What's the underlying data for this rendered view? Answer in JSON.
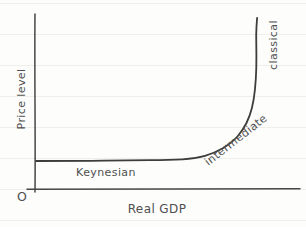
{
  "figure": {
    "origin_label": "O",
    "colors": {
      "ink": "#474747",
      "curve_ink": "#3d3d3d",
      "paper": "#fdfdfc",
      "ruled_line": "#efefec",
      "label_gray": "#4f4f4f"
    }
  },
  "chart_data": {
    "type": "line",
    "title": "",
    "xlabel": "Real GDP",
    "ylabel": "Price level",
    "xlim": [
      0,
      100
    ],
    "ylim": [
      0,
      100
    ],
    "grid": false,
    "axis_ticks": "none",
    "series": [
      {
        "name": "aggregate-supply-curve",
        "x": [
          0.4,
          17.0,
          35.8,
          50.9,
          60.4,
          67.9,
          74.3,
          78.5,
          81.1,
          82.6,
          83.4,
          83.6,
          83.4,
          83.8
        ],
        "y": [
          16.0,
          16.0,
          16.3,
          16.6,
          17.4,
          20.6,
          26.3,
          33.7,
          41.7,
          50.9,
          62.3,
          76.6,
          88.0,
          97.7
        ]
      }
    ],
    "annotations": [
      {
        "text": "Keynesian",
        "x": 26.8,
        "y": 9.7,
        "rotation": 0
      },
      {
        "text": "intermediate",
        "x": 75.8,
        "y": 28.0,
        "rotation": -38
      },
      {
        "text": "classical",
        "x": 89.8,
        "y": 82.3,
        "rotation": -90
      }
    ]
  }
}
